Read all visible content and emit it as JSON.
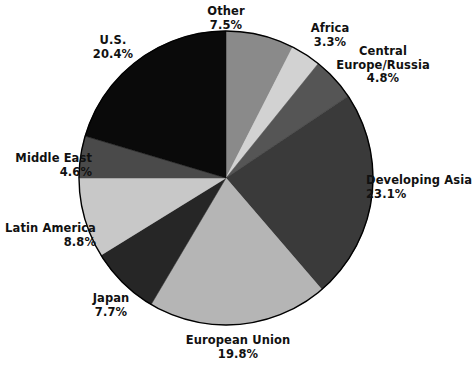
{
  "chart_data": {
    "type": "pie",
    "title": "",
    "subtitle": "",
    "xlabel": "",
    "ylabel": "",
    "legend_position": "none",
    "grid": false,
    "value_unit": "%",
    "start_angle_deg": 0,
    "direction": "clockwise",
    "categories": [
      "Other",
      "Africa",
      "Central Europe/Russia",
      "Developing Asia",
      "European Union",
      "Japan",
      "Latin America",
      "Middle East",
      "U.S."
    ],
    "values": [
      7.5,
      3.3,
      4.8,
      23.1,
      19.8,
      7.7,
      8.8,
      4.6,
      20.4
    ],
    "total": 100.0,
    "colors": [
      "#8a8a8a",
      "#d2d2d2",
      "#555555",
      "#3a3a3a",
      "#b5b5b5",
      "#262626",
      "#c8c8c8",
      "#4a4a4a",
      "#0a0a0a"
    ],
    "slices": [
      {
        "label": "Other",
        "value": 7.5,
        "value_text": "7.5%",
        "color": "#8a8a8a"
      },
      {
        "label": "Africa",
        "value": 3.3,
        "value_text": "3.3%",
        "color": "#d2d2d2"
      },
      {
        "label": "Central Europe/Russia",
        "value": 4.8,
        "value_text": "4.8%",
        "color": "#555555"
      },
      {
        "label": "Developing Asia",
        "value": 23.1,
        "value_text": "23.1%",
        "color": "#3a3a3a"
      },
      {
        "label": "European Union",
        "value": 19.8,
        "value_text": "19.8%",
        "color": "#b5b5b5"
      },
      {
        "label": "Japan",
        "value": 7.7,
        "value_text": "7.7%",
        "color": "#262626"
      },
      {
        "label": "Latin America",
        "value": 8.8,
        "value_text": "8.8%",
        "color": "#c8c8c8"
      },
      {
        "label": "Middle East",
        "value": 4.6,
        "value_text": "4.6%",
        "color": "#4a4a4a"
      },
      {
        "label": "U.S.",
        "value": 20.4,
        "value_text": "20.4%",
        "color": "#0a0a0a"
      }
    ]
  },
  "labels": {
    "other": {
      "name": "Other",
      "value": "7.5%"
    },
    "africa": {
      "name": "Africa",
      "value": "3.3%"
    },
    "central_europe": {
      "name_line1": "Central",
      "name_line2": "Europe/Russia",
      "value": "4.8%"
    },
    "developing_asia": {
      "name": "Developing Asia",
      "value": "23.1%"
    },
    "european_union": {
      "name": "European Union",
      "value": "19.8%"
    },
    "japan": {
      "name": "Japan",
      "value": "7.7%"
    },
    "latin_america": {
      "name": "Latin America",
      "value": "8.8%"
    },
    "middle_east": {
      "name": "Middle East",
      "value": "4.6%"
    },
    "us": {
      "name": "U.S.",
      "value": "20.4%"
    }
  },
  "geometry": {
    "center_x": 226,
    "center_y": 178,
    "radius": 147,
    "outline_color": "#000000"
  }
}
